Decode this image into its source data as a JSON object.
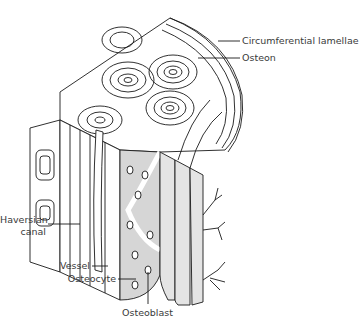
{
  "figure": {
    "colors": {
      "line": "#1a1a1a",
      "fill_gray": "#d6d6d6",
      "text": "#3a3a3a",
      "background": "#ffffff"
    }
  },
  "labels": {
    "circumferential_lamellae": "Circumferential lamellae",
    "osteon": "Osteon",
    "haversian_canal_line1": "Haversian",
    "haversian_canal_line2": "canal",
    "vessel": "Vessel",
    "osteocyte": "Osteocyte",
    "osteoblast": "Osteoblast"
  }
}
